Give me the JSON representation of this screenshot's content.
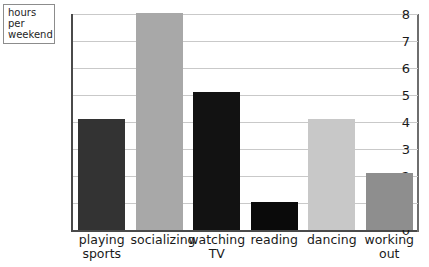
{
  "axis_unit_label": "hours per\nweekend",
  "chart_data": {
    "type": "bar",
    "title": "",
    "subtitle": "",
    "xlabel": "",
    "ylabel": "hours per weekend",
    "ylim": [
      0,
      8
    ],
    "yticks": [
      "0",
      "1",
      "2",
      "3",
      "4",
      "5",
      "6",
      "7",
      "8"
    ],
    "grid": true,
    "legend": "none",
    "categories": [
      "playing\nsports",
      "socializing",
      "watching\nTV",
      "reading",
      "dancing",
      "working\nout"
    ],
    "values": [
      4.1,
      8.05,
      5.1,
      1.05,
      4.1,
      2.1
    ],
    "bar_colors": [
      "#333333",
      "#a8a8a8",
      "#121212",
      "#0a0a0a",
      "#c8c8c8",
      "#8e8e8e"
    ],
    "bars": [
      {
        "category": "playing sports",
        "value": 4.1,
        "color": "#333333"
      },
      {
        "category": "socializing",
        "value": 8.05,
        "color": "#a8a8a8"
      },
      {
        "category": "watching TV",
        "value": 5.1,
        "color": "#121212"
      },
      {
        "category": "reading",
        "value": 1.05,
        "color": "#0a0a0a"
      },
      {
        "category": "dancing",
        "value": 4.1,
        "color": "#c8c8c8"
      },
      {
        "category": "working out",
        "value": 2.1,
        "color": "#8e8e8e"
      }
    ]
  }
}
